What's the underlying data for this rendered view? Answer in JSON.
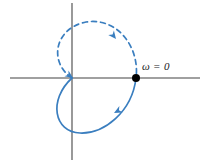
{
  "figure": {
    "type": "nyquist-plot",
    "background": "#ffffff",
    "width": 207,
    "height": 166,
    "axis_color": "#808080",
    "curve_color": "#3a7ebf",
    "marker_color": "#000000",
    "text_color": "#1a1a1a"
  },
  "axes": {
    "x_axis": {
      "name": "horizontal-axis",
      "y": 78,
      "x_start": 10,
      "x_end": 200
    },
    "y_axis": {
      "name": "vertical-axis",
      "x": 72,
      "y_start": 3,
      "y_end": 160
    },
    "origin": {
      "x": 72,
      "y": 78
    }
  },
  "markers": {
    "omega_zero": {
      "label": "ω = 0",
      "point_x": 136,
      "point_y": 78,
      "radius": 4,
      "label_x": 142,
      "label_y": 60
    }
  },
  "curves": [
    {
      "name": "upper-branch",
      "style": "dashed",
      "dash_pattern": "5 4",
      "description": "dashed loop from origin crossing up over the top and down to omega=0 point",
      "path": "M 72 78 C 48 62, 55 28, 86 22 C 118 17, 140 48, 136 78"
    },
    {
      "name": "lower-branch",
      "style": "solid",
      "description": "solid loop from omega=0 point down and around to the left then back up to the origin crossing",
      "path": "M 136 78 C 132 112, 104 134, 80 133 C 54 132, 48 100, 72 78"
    }
  ],
  "arrowheads": [
    {
      "name": "arrow-upper-branch",
      "x": 116,
      "y": 39,
      "angle": 52,
      "branch": "upper-branch"
    },
    {
      "name": "arrow-lower-branch",
      "x": 114,
      "y": 113,
      "angle": 152,
      "branch": "lower-branch"
    },
    {
      "name": "arrow-origin-crossing",
      "x": 73,
      "y": 78,
      "angle": 35,
      "branch": "lower-branch"
    }
  ]
}
